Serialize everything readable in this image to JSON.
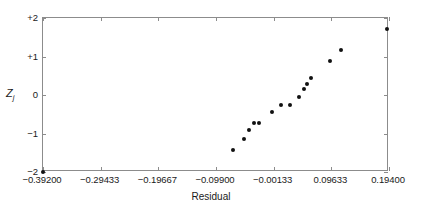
{
  "chart_data": {
    "type": "scatter",
    "title": "",
    "xlabel": "Residual",
    "ylabel": "Zj",
    "ylabel_base": "Z",
    "ylabel_sub": "j",
    "xlim": [
      -0.392,
      0.194
    ],
    "ylim": [
      -2,
      2
    ],
    "grid": false,
    "legend": null,
    "xticks": [
      -0.392,
      -0.29433,
      -0.19667,
      -0.099,
      -0.00133,
      0.09633,
      0.194
    ],
    "xticklabels": [
      "−0.39200",
      "−0.29433",
      "−0.19667",
      "−0.09900",
      "−0.00133",
      "0.09633",
      "0.19400"
    ],
    "yticks": [
      2,
      1,
      0,
      -1,
      -2
    ],
    "yticklabels": [
      "+2",
      "+1",
      "0",
      "−1",
      "−2"
    ],
    "marker": "filled-circle",
    "marker_color": "#111111",
    "marker_size": 4,
    "frame_color": "#8c8c8c",
    "points": [
      {
        "x": -0.392,
        "y": -2.0
      },
      {
        "x": -0.0706,
        "y": -1.43
      },
      {
        "x": -0.052,
        "y": -1.13
      },
      {
        "x": -0.0435,
        "y": -0.9
      },
      {
        "x": -0.035,
        "y": -0.74
      },
      {
        "x": -0.0265,
        "y": -0.73
      },
      {
        "x": -0.0045,
        "y": -0.43
      },
      {
        "x": 0.011,
        "y": -0.25
      },
      {
        "x": 0.0265,
        "y": -0.25
      },
      {
        "x": 0.0415,
        "y": -0.06
      },
      {
        "x": 0.05,
        "y": 0.16
      },
      {
        "x": 0.055,
        "y": 0.28
      },
      {
        "x": 0.062,
        "y": 0.44
      },
      {
        "x": 0.094,
        "y": 0.88
      },
      {
        "x": 0.112,
        "y": 1.17
      },
      {
        "x": 0.191,
        "y": 1.72
      }
    ]
  }
}
